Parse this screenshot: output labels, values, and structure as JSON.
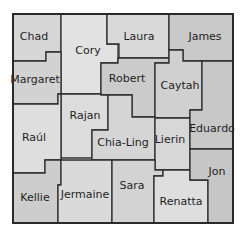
{
  "map": {
    "frame": {
      "x": 13,
      "y": 14,
      "width": 220,
      "height": 209
    },
    "colors": {
      "border": "#2e2e2e",
      "text": "#1f1f1f",
      "fill_light": "#e4e4e4",
      "fill_mid": "#cfcfcf",
      "fill_dark": "#b9b9b9"
    },
    "regions": [
      {
        "name": "Chad",
        "label": "Chad",
        "label_x": 34,
        "label_y": 37,
        "points": "13,14 61,14 61,52 46,52 46,61 13,61",
        "fill": "#d6d6d6"
      },
      {
        "name": "Cory",
        "label": "Cory",
        "label_x": 88,
        "label_y": 51,
        "points": "61,14 107,14 107,44 118,44 118,63 101,63 101,94 61,94",
        "fill": "#e2e2e2"
      },
      {
        "name": "Laura",
        "label": "Laura",
        "label_x": 139,
        "label_y": 37,
        "points": "107,14 169,14 169,58 119,58 119,44 107,44",
        "fill": "#d9d9d9"
      },
      {
        "name": "James",
        "label": "James",
        "label_x": 205,
        "label_y": 37,
        "points": "169,14 233,14 233,61 183,61 183,50 169,50",
        "fill": "#c9c9c9"
      },
      {
        "name": "Margaret",
        "label": "Margaret",
        "label_x": 35,
        "label_y": 80,
        "points": "13,61 46,61 46,52 61,52 61,94 58,94 58,104 13,104",
        "fill": "#d2d2d2"
      },
      {
        "name": "Robert",
        "label": "Robert",
        "label_x": 127,
        "label_y": 79,
        "points": "101,63 118,63 118,58 169,58 169,63 155,63 155,117 132,117 132,95 101,95",
        "fill": "#cbcbcb"
      },
      {
        "name": "Caytah",
        "label": "Caytah",
        "label_x": 180,
        "label_y": 86,
        "points": "169,50 183,50 183,61 202,61 202,110 190,110 190,118 155,118 155,63 169,63",
        "fill": "#d0d0d0"
      },
      {
        "name": "Rajan",
        "label": "Rajan",
        "label_x": 85,
        "label_y": 116,
        "points": "61,94 101,94 101,95 108,95 108,130 92,130 92,158 61,158",
        "fill": "#dcdcdc"
      },
      {
        "name": "Chia-Ling",
        "label": "Chia-Ling",
        "label_x": 123,
        "label_y": 143,
        "points": "108,95 132,95 132,117 155,117 155,160 92,160 92,130 108,130",
        "fill": "#d5d5d5"
      },
      {
        "name": "Raul",
        "label": "Raúl",
        "label_x": 34,
        "label_y": 138,
        "points": "13,104 58,104 58,94 61,94 61,160 45,160 45,173 13,173",
        "fill": "#dedede"
      },
      {
        "name": "Lierin",
        "label": "Lierin",
        "label_x": 170,
        "label_y": 140,
        "points": "155,118 190,118 190,170 155,170",
        "fill": "#d7d7d7"
      },
      {
        "name": "Eduardo",
        "label": "Eduardo",
        "label_x": 212,
        "label_y": 129,
        "points": "202,61 233,61 233,149 190,149 190,110 202,110",
        "fill": "#c8c8c8"
      },
      {
        "name": "Kellie",
        "label": "Kellie",
        "label_x": 35,
        "label_y": 198,
        "points": "13,173 45,173 45,160 61,160 61,185 58,185 58,223 13,223",
        "fill": "#cdcdcd"
      },
      {
        "name": "Jermaine",
        "label": "Jermaine",
        "label_x": 85,
        "label_y": 195,
        "points": "61,160 112,160 112,223 58,223 58,185 61,185",
        "fill": "#dadada"
      },
      {
        "name": "Sara",
        "label": "Sara",
        "label_x": 132,
        "label_y": 186,
        "points": "112,160 155,160 155,170 163,170 163,176 154,176 154,223 112,223",
        "fill": "#d3d3d3"
      },
      {
        "name": "Renatta",
        "label": "Renatta",
        "label_x": 181,
        "label_y": 202,
        "points": "154,176 163,176 163,170 190,170 190,180 208,180 208,223 154,223",
        "fill": "#dedede"
      },
      {
        "name": "Jon",
        "label": "Jon",
        "label_x": 217,
        "label_y": 172,
        "points": "190,149 233,149 233,223 208,223 208,180 190,180",
        "fill": "#c6c6c6"
      }
    ]
  }
}
